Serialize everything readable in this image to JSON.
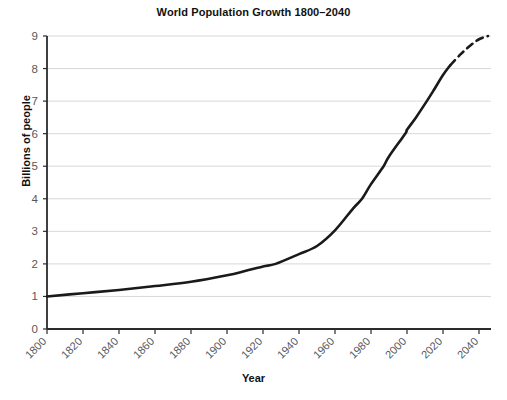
{
  "chart_data": {
    "type": "line",
    "title": "World Population Growth 1800–2040",
    "xlabel": "Year",
    "ylabel": "Billions of people",
    "xlim": [
      1800,
      2045
    ],
    "ylim": [
      0,
      9
    ],
    "grid": "horizontal",
    "legend": "none",
    "xticks": [
      "1800",
      "1820",
      "1840",
      "1860",
      "1880",
      "1900",
      "1920",
      "1940",
      "1960",
      "1980",
      "2000",
      "2020",
      "2040"
    ],
    "xtick_values": [
      1800,
      1820,
      1840,
      1860,
      1880,
      1900,
      1920,
      1940,
      1960,
      1980,
      2000,
      2020,
      2040
    ],
    "xtick_rotation": -45,
    "yticks": [
      "0",
      "1",
      "2",
      "3",
      "4",
      "5",
      "6",
      "7",
      "8",
      "9"
    ],
    "ytick_values": [
      0,
      1,
      2,
      3,
      4,
      5,
      6,
      7,
      8,
      9
    ],
    "series": [
      {
        "name": "Historical population",
        "style": "solid",
        "color": "#1a1a1a",
        "width": 2.6,
        "x": [
          1800,
          1820,
          1840,
          1860,
          1880,
          1900,
          1910,
          1920,
          1927,
          1940,
          1950,
          1960,
          1970,
          1975,
          1980,
          1987,
          1990,
          1999,
          2000,
          2005,
          2011,
          2015,
          2020,
          2024
        ],
        "values": [
          1.0,
          1.1,
          1.2,
          1.32,
          1.45,
          1.65,
          1.78,
          1.92,
          2.0,
          2.3,
          2.55,
          3.03,
          3.7,
          4.0,
          4.45,
          5.0,
          5.3,
          6.0,
          6.12,
          6.5,
          7.0,
          7.35,
          7.8,
          8.1
        ]
      },
      {
        "name": "Projected population",
        "style": "dashed",
        "color": "#1a1a1a",
        "width": 2.6,
        "x": [
          2024,
          2030,
          2035,
          2040,
          2045
        ],
        "values": [
          8.1,
          8.45,
          8.7,
          8.9,
          9.0
        ]
      }
    ],
    "annotations": []
  },
  "colors": {
    "line": "#1a1a1a",
    "grid": "#d8d8d8",
    "axis": "#2b2b2b",
    "tick_label": "#58585a",
    "title": "#111111",
    "background": "#ffffff"
  }
}
